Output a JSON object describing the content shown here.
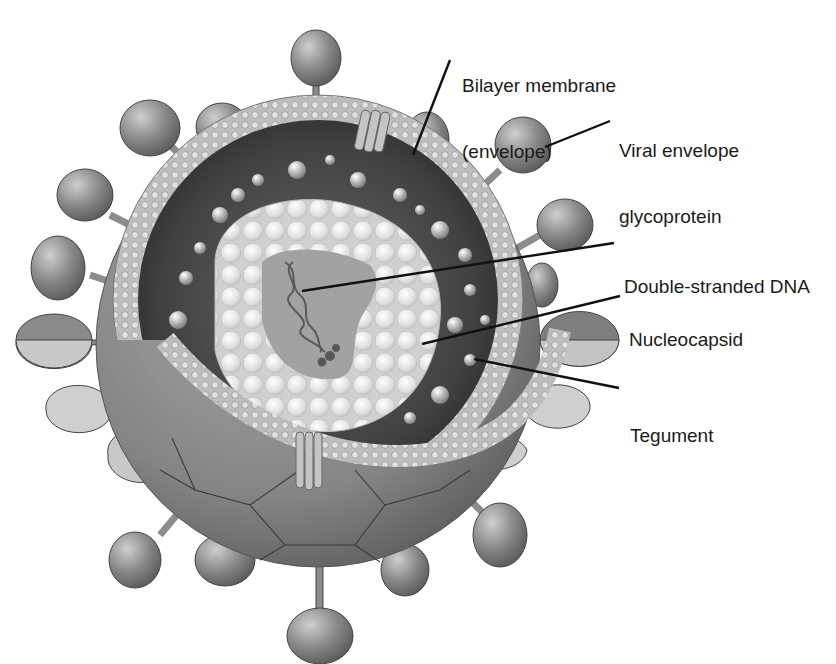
{
  "diagram": {
    "labels": [
      {
        "id": "bilayer",
        "line1": "Bilayer membrane",
        "line2": "(envelope)"
      },
      {
        "id": "glycoprotein",
        "line1": "Viral envelope",
        "line2": "glycoprotein"
      },
      {
        "id": "dna",
        "line1": "Double-stranded DNA"
      },
      {
        "id": "nucleocapsid",
        "line1": "Nucleocapsid"
      },
      {
        "id": "tegument",
        "line1": "Tegument"
      }
    ],
    "colors": {
      "background": "#ffffff",
      "label_text": "#1a1a1a",
      "leader_line": "#111111",
      "outer_sphere": "#8a8a8a",
      "membrane": "#b8b8b8",
      "tegument": "#4a4a4a",
      "nucleocapsid": "#e4e4e4",
      "core": "#9a9a9a",
      "glycoprotein": "#7a7a7a"
    }
  }
}
